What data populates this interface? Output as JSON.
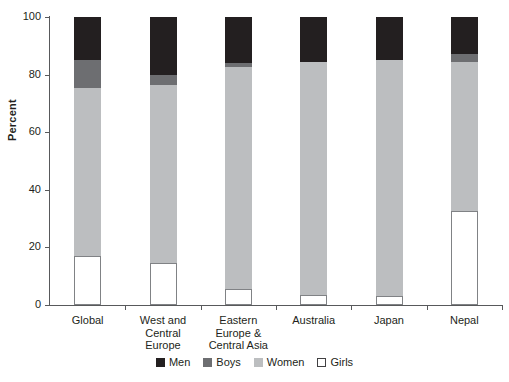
{
  "chart_data": {
    "type": "bar",
    "subtype": "stacked-bar",
    "title": "",
    "xlabel": "",
    "ylabel": "Percent",
    "ylim": [
      0,
      100
    ],
    "yticks": [
      0,
      20,
      40,
      60,
      80,
      100
    ],
    "ytick_labels": [
      "0",
      "20",
      "40",
      "60",
      "80",
      "100"
    ],
    "grid": false,
    "legend_position": "bottom-center",
    "categories": [
      "Global",
      "West and\nCentral\nEurope",
      "Eastern\nEurope &\nCentral Asia",
      "Australia",
      "Japan",
      "Nepal"
    ],
    "series": [
      {
        "name": "Girls",
        "color": "#ffffff",
        "values": [
          17.0,
          14.5,
          5.5,
          3.5,
          3.0,
          32.5
        ]
      },
      {
        "name": "Women",
        "color": "#bcbec0",
        "values": [
          58.5,
          62.0,
          77.0,
          81.0,
          82.0,
          52.0
        ]
      },
      {
        "name": "Boys",
        "color": "#6d6e71",
        "values": [
          9.5,
          3.5,
          1.5,
          0.0,
          0.0,
          2.5
        ]
      },
      {
        "name": "Men",
        "color": "#231f20",
        "values": [
          15.0,
          20.0,
          16.0,
          15.5,
          15.0,
          13.0
        ]
      }
    ],
    "stack_order_bottom_to_top": [
      "Girls",
      "Women",
      "Boys",
      "Men"
    ]
  },
  "legend": {
    "items": [
      {
        "label": "Men",
        "swatch": "men-swatch"
      },
      {
        "label": "Boys",
        "swatch": "boys-swatch"
      },
      {
        "label": "Women",
        "swatch": "women-swatch"
      },
      {
        "label": "Girls",
        "swatch": "girls-swatch"
      }
    ]
  },
  "axis": {
    "y_title": "Percent"
  }
}
